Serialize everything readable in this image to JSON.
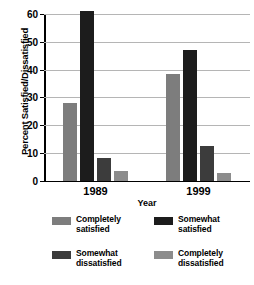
{
  "chart_data": {
    "type": "bar",
    "title": "",
    "subtitle": "",
    "xlabel": "Year",
    "ylabel": "Percent Satisfied/Dissatisfied",
    "categories": [
      "1989",
      "1999"
    ],
    "ylim": [
      0,
      60
    ],
    "yticks": [
      0,
      10,
      20,
      30,
      40,
      50,
      60
    ],
    "ytick_labels": [
      "0",
      "10",
      "20",
      "30",
      "40",
      "50",
      "60"
    ],
    "grid": true,
    "legend_position": "bottom",
    "series": [
      {
        "name": "Completely satisfied",
        "color": "#7d7d7d",
        "values": [
          28,
          38.5
        ]
      },
      {
        "name": "Somewhat satisfied",
        "color": "#1c1c1c",
        "values": [
          61,
          47
        ]
      },
      {
        "name": "Somewhat dissatisfied",
        "color": "#3c3c3c",
        "values": [
          8,
          12.5
        ]
      },
      {
        "name": "Completely dissatisfied",
        "color": "#8c8c8c",
        "values": [
          3.5,
          2.8
        ]
      }
    ]
  }
}
